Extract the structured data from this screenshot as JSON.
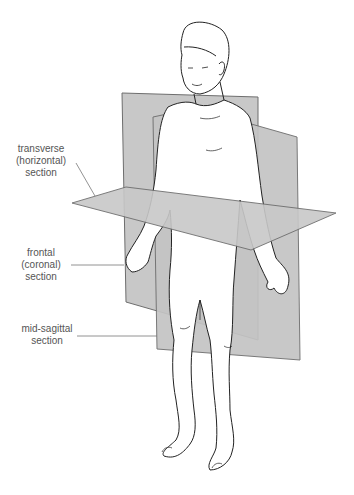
{
  "figure": {
    "colors": {
      "plane_fill": "#c8c8c8",
      "plane_edge": "#6e6e6e",
      "outline": "#222222",
      "label_text": "#555555",
      "leader_line": "#777777"
    }
  },
  "labels": [
    {
      "id": "transverse",
      "lines": [
        "transverse",
        "(horizontal)",
        "section"
      ]
    },
    {
      "id": "frontal",
      "lines": [
        "frontal",
        "(coronal)",
        "section"
      ]
    },
    {
      "id": "mid-sagittal",
      "lines": [
        "mid-sagittal",
        "section"
      ]
    }
  ]
}
